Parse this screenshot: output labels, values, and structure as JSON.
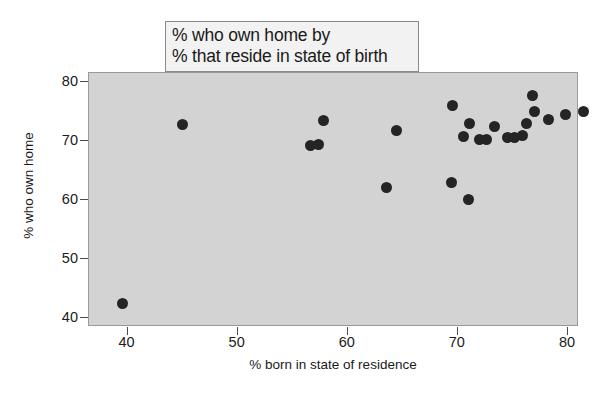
{
  "chart_data": {
    "type": "scatter",
    "title": "% who own home by % that reside in state of birth",
    "title_lines": [
      "% who own home by",
      "% that reside in state of birth"
    ],
    "xlabel": "% born in state of residence",
    "ylabel": "% who own home",
    "xlim": [
      36.5,
      81.0
    ],
    "ylim": [
      38.5,
      81.5
    ],
    "xticks": [
      40,
      50,
      60,
      70,
      80
    ],
    "xtick_labels": [
      "40",
      "50",
      "60",
      "70",
      "80"
    ],
    "yticks": [
      40,
      50,
      60,
      70,
      80
    ],
    "ytick_labels": [
      "40",
      "50",
      "60",
      "70",
      "80"
    ],
    "grid": false,
    "legend": null,
    "panel_background": "#d3d3d3",
    "marker_color": "#242424",
    "marker_size": 11,
    "n_points": 24,
    "x": [
      39.5,
      45.0,
      57.3,
      57.8,
      56.6,
      63.5,
      64.4,
      69.4,
      69.5,
      70.5,
      71.0,
      71.1,
      72.0,
      72.6,
      73.3,
      74.5,
      75.1,
      75.9,
      76.2,
      76.8,
      77.0,
      78.2,
      79.8,
      81.4
    ],
    "y": [
      42.5,
      72.8,
      69.4,
      73.4,
      69.2,
      62.2,
      71.7,
      62.9,
      76.0,
      70.7,
      60.1,
      73.0,
      70.2,
      70.3,
      72.5,
      70.5,
      70.6,
      71.0,
      73.0,
      77.7,
      75.0,
      73.6,
      74.4,
      75.0
    ],
    "points": [
      {
        "x": 39.5,
        "y": 42.5
      },
      {
        "x": 45.0,
        "y": 72.8
      },
      {
        "x": 56.6,
        "y": 69.2
      },
      {
        "x": 57.3,
        "y": 69.4
      },
      {
        "x": 57.8,
        "y": 73.4
      },
      {
        "x": 63.5,
        "y": 62.2
      },
      {
        "x": 64.4,
        "y": 71.7
      },
      {
        "x": 69.4,
        "y": 62.9
      },
      {
        "x": 69.5,
        "y": 76.0
      },
      {
        "x": 70.5,
        "y": 70.7
      },
      {
        "x": 71.0,
        "y": 60.1
      },
      {
        "x": 71.1,
        "y": 73.0
      },
      {
        "x": 72.0,
        "y": 70.2
      },
      {
        "x": 72.6,
        "y": 70.3
      },
      {
        "x": 73.3,
        "y": 72.5
      },
      {
        "x": 74.5,
        "y": 70.5
      },
      {
        "x": 75.1,
        "y": 70.6
      },
      {
        "x": 75.9,
        "y": 71.0
      },
      {
        "x": 76.2,
        "y": 73.0
      },
      {
        "x": 76.8,
        "y": 77.7
      },
      {
        "x": 77.0,
        "y": 75.0
      },
      {
        "x": 78.2,
        "y": 73.6
      },
      {
        "x": 79.8,
        "y": 74.4
      },
      {
        "x": 81.4,
        "y": 75.0
      }
    ]
  }
}
